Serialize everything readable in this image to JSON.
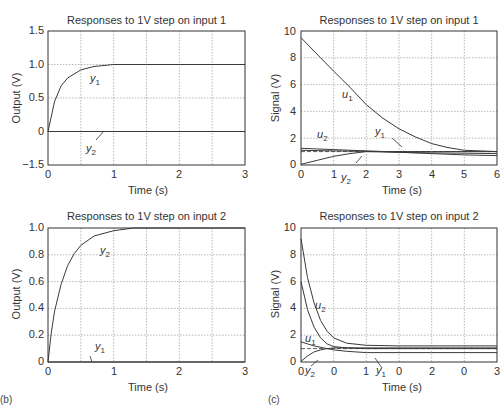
{
  "figure": {
    "panel_tags": {
      "left": "(b)",
      "right": "(c)"
    },
    "caption_fragment": "(cut off caption text)"
  },
  "chart_data": [
    {
      "type": "line",
      "title": "Responses to 1V step on input 1",
      "xlabel": "Time (s)",
      "ylabel": "Output (V)",
      "xlim": [
        0,
        3
      ],
      "ylim": [
        -1.5,
        1.5
      ],
      "xticks": [
        "0",
        "1",
        "2",
        "3"
      ],
      "yticks": [
        "1.5",
        "1.0",
        "0.5",
        "0",
        "−1.5"
      ],
      "grid": true,
      "series": [
        {
          "name": "y1",
          "x": [
            0,
            0.1,
            0.2,
            0.3,
            0.5,
            0.7,
            1.0,
            1.5,
            2,
            3
          ],
          "values": [
            0,
            0.45,
            0.68,
            0.8,
            0.92,
            0.97,
            1.0,
            1.0,
            1.0,
            1.0
          ]
        },
        {
          "name": "y2",
          "x": [
            0,
            3
          ],
          "values": [
            0,
            0
          ]
        }
      ],
      "labels": {
        "y1": "y",
        "y1_sub": "1",
        "y2": "y",
        "y2_sub": "2"
      }
    },
    {
      "type": "line",
      "title": "Responses to 1V step on input 1",
      "xlabel": "Time (s)",
      "ylabel": "Signal (V)",
      "xlim": [
        0,
        6
      ],
      "ylim": [
        0,
        10
      ],
      "xticks": [
        "0",
        "1",
        "2",
        "3",
        "4",
        "5",
        "6"
      ],
      "yticks": [
        "10",
        "8",
        "6",
        "4",
        "2",
        "0"
      ],
      "grid": true,
      "reference_line": {
        "value": 1.0,
        "style": "dashed"
      },
      "series": [
        {
          "name": "u1",
          "x": [
            0,
            0.6,
            1,
            1.5,
            2,
            2.5,
            3,
            3.5,
            4,
            4.5,
            5,
            5.5,
            6
          ],
          "values": [
            9.5,
            8.0,
            7.0,
            5.8,
            4.5,
            3.5,
            2.7,
            2.1,
            1.6,
            1.3,
            1.1,
            1.05,
            1.0
          ]
        },
        {
          "name": "u2",
          "x": [
            0,
            1,
            2,
            3,
            4,
            5,
            6
          ],
          "values": [
            1.25,
            1.15,
            1.05,
            0.95,
            0.9,
            0.88,
            0.85
          ]
        },
        {
          "name": "y1",
          "x": [
            0,
            1,
            2,
            3,
            4,
            5,
            6
          ],
          "values": [
            1.1,
            1.05,
            1.02,
            1.0,
            1.0,
            1.0,
            1.0
          ]
        },
        {
          "name": "y2",
          "x": [
            0,
            0.5,
            1,
            1.5,
            2,
            3,
            4,
            5,
            6
          ],
          "values": [
            0.05,
            0.35,
            0.65,
            0.85,
            1.0,
            0.95,
            0.85,
            0.75,
            0.7
          ]
        }
      ],
      "labels": {
        "u1": "u",
        "u1_sub": "1",
        "u2": "u",
        "u2_sub": "2",
        "y1": "y",
        "y1_sub": "1",
        "y2": "y",
        "y2_sub": "2"
      }
    },
    {
      "type": "line",
      "title": "Responses to 1V step on input 2",
      "xlabel": "Time (s)",
      "ylabel": "Output (V)",
      "xlim": [
        0,
        3
      ],
      "ylim": [
        0,
        1.0
      ],
      "xticks": [
        "0",
        "1",
        "2",
        "3"
      ],
      "yticks": [
        "1.0",
        "0.8",
        "0.6",
        "0.4",
        "0.2",
        "0"
      ],
      "grid": true,
      "series": [
        {
          "name": "y2",
          "x": [
            0,
            0.05,
            0.1,
            0.2,
            0.3,
            0.4,
            0.5,
            0.7,
            1.0,
            1.3,
            2,
            3
          ],
          "values": [
            0,
            0.22,
            0.38,
            0.58,
            0.72,
            0.81,
            0.87,
            0.94,
            0.98,
            1.0,
            1.0,
            1.0
          ]
        },
        {
          "name": "y1",
          "x": [
            0,
            3
          ],
          "values": [
            0,
            0
          ]
        }
      ],
      "labels": {
        "y1": "y",
        "y1_sub": "1",
        "y2": "y",
        "y2_sub": "2"
      }
    },
    {
      "type": "line",
      "title": "Responses to 1V step on input 2",
      "xlabel": "Time (s)",
      "ylabel": "Signal (V)",
      "xlim": [
        0,
        3
      ],
      "ylim": [
        0,
        10
      ],
      "xticks": [
        "0",
        "0",
        "1",
        "0",
        "2",
        "0",
        "3"
      ],
      "yticks": [
        "10",
        "8",
        "6",
        "4",
        "2",
        "0"
      ],
      "grid": true,
      "reference_line": {
        "value": 1.0,
        "style": "dashed"
      },
      "series": [
        {
          "name": "u2",
          "x": [
            0,
            0.1,
            0.2,
            0.3,
            0.4,
            0.5,
            0.7,
            1.0,
            1.5,
            2,
            3
          ],
          "values": [
            9.2,
            6.3,
            4.4,
            3.1,
            2.3,
            1.8,
            1.4,
            1.25,
            1.2,
            1.2,
            1.2
          ]
        },
        {
          "name": "u1",
          "x": [
            0,
            0.1,
            0.2,
            0.3,
            0.4,
            0.5,
            0.7,
            1.0,
            1.5,
            2,
            3
          ],
          "values": [
            6.0,
            3.9,
            2.6,
            1.8,
            1.35,
            1.15,
            1.05,
            1.0,
            1.0,
            1.0,
            1.0
          ]
        },
        {
          "name": "y1",
          "x": [
            0,
            0.2,
            0.4,
            0.5,
            0.7,
            1.0,
            2,
            3
          ],
          "values": [
            1.5,
            1.2,
            1.0,
            0.9,
            0.8,
            0.7,
            0.7,
            0.7
          ]
        },
        {
          "name": "y2",
          "x": [
            0,
            0.1,
            0.2,
            0.3,
            0.4,
            0.5,
            1.0,
            2,
            3
          ],
          "values": [
            0.05,
            0.45,
            0.75,
            0.9,
            1.0,
            1.05,
            1.05,
            1.05,
            1.05
          ]
        }
      ],
      "labels": {
        "u1": "u",
        "u1_sub": "1",
        "u2": "u",
        "u2_sub": "2",
        "y1": "y",
        "y1_sub": "1",
        "y2": "y",
        "y2_sub": "2"
      }
    }
  ]
}
